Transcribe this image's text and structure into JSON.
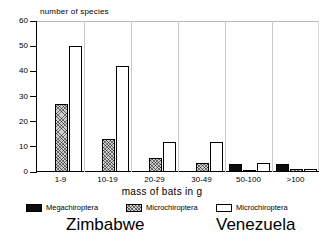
{
  "chart_data": {
    "type": "bar",
    "title": "",
    "ylabel": "number of species",
    "xlabel": "mass of bats in g",
    "categories": [
      "1-9",
      "10-19",
      "20-29",
      "30-49",
      "50-100",
      ">100"
    ],
    "ylim": [
      0,
      60
    ],
    "yticks": [
      0,
      10,
      20,
      30,
      40,
      50,
      60
    ],
    "ytick_labels": [
      "0",
      "10",
      "20",
      "30",
      "40",
      "50",
      "60"
    ],
    "grid": false,
    "legend_position": "below-axes",
    "series": [
      {
        "name": "Megachiroptera",
        "region": "Zimbabwe",
        "color": "#0d0d0d",
        "fill": "solid-black",
        "values": [
          0,
          0,
          0,
          0,
          3,
          3
        ]
      },
      {
        "name": "Microchiroptera",
        "region": "Zimbabwe",
        "color": "#d0d0d0",
        "fill": "cross-hatched",
        "values": [
          27,
          13,
          5.5,
          3.5,
          0.5,
          1
        ]
      },
      {
        "name": "Microchiroptera",
        "region": "Venezuela",
        "color": "#ffffff",
        "fill": "open-white",
        "values": [
          50,
          42,
          12,
          12,
          3.5,
          1
        ]
      }
    ]
  },
  "legend": {
    "entries": [
      {
        "label": "Megachiroptera",
        "swatch": "mega"
      },
      {
        "label": "Microchiroptera",
        "swatch": "micro-zw"
      },
      {
        "label": "Microchiroptera",
        "swatch": "micro-vz"
      }
    ]
  },
  "captions": {
    "zimbabwe": "Zimbabwe",
    "venezuela": "Venezuela"
  }
}
